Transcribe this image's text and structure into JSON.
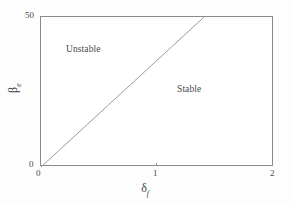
{
  "chart_data": {
    "type": "line",
    "title": "",
    "subtitle": "",
    "xlabel_symbol": "δ",
    "xlabel_subscript": "f",
    "ylabel_symbol": "β",
    "ylabel_subscript": "e",
    "xlim": [
      0,
      2
    ],
    "ylim": [
      0,
      50
    ],
    "xticks": [
      0,
      1,
      2
    ],
    "xticklabels": [
      "0",
      "1",
      "2"
    ],
    "yticks": [
      0,
      50
    ],
    "yticklabels": [
      "0",
      "50"
    ],
    "grid": false,
    "legend": "none",
    "series": [
      {
        "name": "stability boundary",
        "type": "line",
        "x": [
          0,
          1.4
        ],
        "y": [
          0,
          50
        ],
        "color": "#9a9a9a",
        "linewidth": 1,
        "slope": 35.7
      }
    ],
    "annotations": [
      {
        "text": "Unstable",
        "x": 0.24,
        "y": 41,
        "region": "upper-left"
      },
      {
        "text": "Stable",
        "x": 1.2,
        "y": 27,
        "region": "lower-right"
      }
    ]
  },
  "axes": {
    "y_tick_top": "50",
    "y_tick_bottom": "0",
    "x_tick_left": "0",
    "x_tick_mid": "1",
    "x_tick_right": "2"
  },
  "labels": {
    "unstable": "Unstable",
    "stable": "Stable"
  },
  "axis_titles": {
    "x_symbol": "δ",
    "x_subscript": "f",
    "y_symbol": "β",
    "y_subscript": "e"
  },
  "colors": {
    "background": "#ffffff",
    "frame": "#8a8a8a",
    "boundary_line": "#9a9a9a",
    "text": "#3a3a3a"
  }
}
